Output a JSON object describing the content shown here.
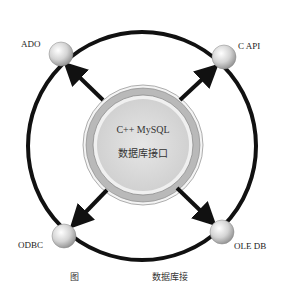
{
  "diagram": {
    "center": {
      "line1": "C++ MySQL",
      "line2": "数据库接口"
    },
    "nodes": [
      {
        "id": "ado",
        "label": "ADO"
      },
      {
        "id": "capi",
        "label": "C API"
      },
      {
        "id": "odbc",
        "label": "ODBC"
      },
      {
        "id": "oledb",
        "label": "OLE DB"
      }
    ],
    "caption": {
      "prefix": "图",
      "suffix": "数据库接"
    },
    "colors": {
      "ring": "#111111",
      "arrow": "#111111",
      "center_fill": "#d9d9d9",
      "center_band": "#b5b5b5",
      "sphere": "#cfcfcf"
    }
  }
}
